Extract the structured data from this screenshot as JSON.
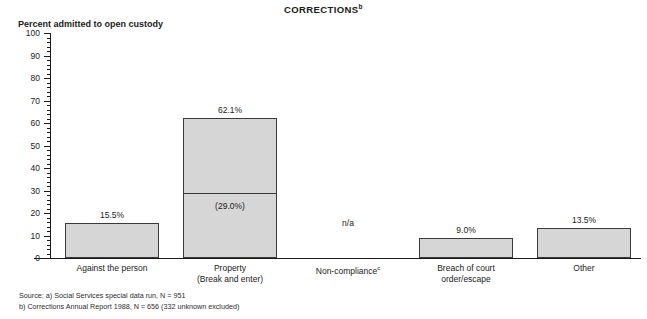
{
  "chart_data": {
    "type": "bar",
    "title": "CORRECTIONS",
    "title_superscript": "b",
    "ylabel": "Percent admitted to open custody",
    "xlabel": "",
    "ylim": [
      0,
      100
    ],
    "ytick_step": 10,
    "yminor_step": 2,
    "grid": false,
    "legend": "none",
    "ytick_labels": [
      "100",
      "90",
      "80",
      "70",
      "60",
      "50",
      "40",
      "30",
      "20",
      "10",
      "0"
    ],
    "ytick_values": [
      100,
      90,
      80,
      70,
      60,
      50,
      40,
      30,
      20,
      10,
      0
    ],
    "categories": [
      "Against the person",
      "Property\n(Break and enter)",
      "Non-compliance",
      "Breach of court\norder/escape",
      "Other"
    ],
    "category_lines": [
      [
        "Against the person"
      ],
      [
        "Property",
        "(Break and enter)"
      ],
      [
        "Non-compliance"
      ],
      [
        "Breach of court",
        "order/escape"
      ],
      [
        "Other"
      ]
    ],
    "category_superscripts": [
      "",
      "",
      "c",
      "",
      ""
    ],
    "values": [
      15.5,
      62.1,
      null,
      9.0,
      13.5
    ],
    "value_labels": [
      "15.5%",
      "62.1%",
      "n/a",
      "9.0%",
      "13.5%"
    ],
    "sub_segment": {
      "category": "Property\n(Break and enter)",
      "value": 29.0,
      "label": "(29.0%)"
    },
    "bar_color": "#d6d6d6",
    "bar_border_color": "#3a3a3a",
    "axis_color": "#1a1a1a"
  },
  "bars": [
    {
      "name": "against-the-person",
      "value": 15.5,
      "label": "15.5%",
      "left": 14,
      "width": 94
    },
    {
      "name": "property-break-and-enter",
      "value": 62.1,
      "label": "62.1%",
      "left": 132,
      "width": 94
    },
    {
      "name": "non-compliance",
      "value": null,
      "label": "n/a",
      "left": 250,
      "width": 94
    },
    {
      "name": "breach-of-court-order-escape",
      "value": 9.0,
      "label": "9.0%",
      "left": 368,
      "width": 94
    },
    {
      "name": "other",
      "value": 13.5,
      "label": "13.5%",
      "left": 486,
      "width": 94
    }
  ],
  "footnotes": {
    "line1": "Source: a) Social Services special data run, N = 951",
    "line2": "b) Corrections Annual Report 1988, N = 656 (332 unknown excluded)"
  }
}
